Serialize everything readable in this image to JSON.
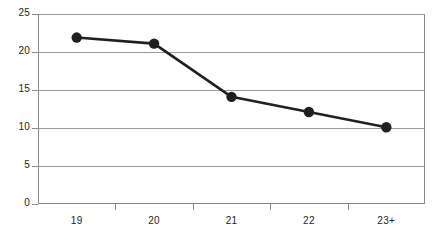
{
  "chart_data": {
    "type": "line",
    "title": "",
    "subtitle": "",
    "xlabel": "",
    "ylabel": "",
    "categories": [
      "19",
      "20",
      "21",
      "22",
      "23+"
    ],
    "series": [
      {
        "name": "",
        "values": [
          21.9,
          21.1,
          14.1,
          12.1,
          10.1
        ]
      }
    ],
    "ylim": [
      0,
      25
    ],
    "yticks": [
      0,
      5,
      10,
      15,
      20,
      25
    ],
    "ytick_labels": [
      "0",
      "5",
      "10",
      "15",
      "20",
      "25"
    ],
    "grid": true,
    "grid_axis": "y",
    "legend": false,
    "legend_position": "none",
    "marker": "circle",
    "line_color": "#231f20",
    "marker_color": "#231f20",
    "grid_color": "#9a9a9a",
    "axis_color": "#888888",
    "text_color": "#231f20",
    "background": "#ffffff",
    "annotations": []
  }
}
